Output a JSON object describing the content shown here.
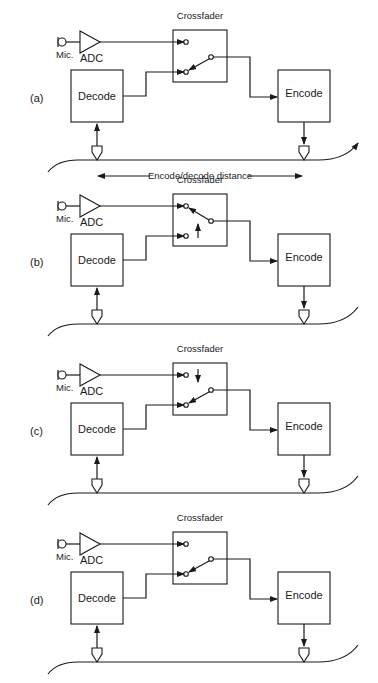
{
  "figure": {
    "ink_color": "#1a1a1a",
    "background": "#ffffff",
    "distance_label": "Encode/decode distance",
    "panels": [
      {
        "id": "a",
        "label": "(a)",
        "crossfader_label": "Crossfader",
        "mic_label": "Mic.",
        "adc_label": "ADC",
        "decode_label": "Decode",
        "encode_label": "Encode",
        "switch_position": "decode",
        "motion_arrow": "none",
        "tape_arrow": true
      },
      {
        "id": "b",
        "label": "(b)",
        "crossfader_label": "Crossfader",
        "mic_label": "Mic.",
        "adc_label": "ADC",
        "decode_label": "Decode",
        "encode_label": "Encode",
        "switch_position": "mic",
        "motion_arrow": "up",
        "tape_arrow": false
      },
      {
        "id": "c",
        "label": "(c)",
        "crossfader_label": "Crossfader",
        "mic_label": "Mic.",
        "adc_label": "ADC",
        "decode_label": "Decode",
        "encode_label": "Encode",
        "switch_position": "decode",
        "motion_arrow": "down",
        "tape_arrow": false
      },
      {
        "id": "d",
        "label": "(d)",
        "crossfader_label": "Crossfader",
        "mic_label": "Mic.",
        "adc_label": "ADC",
        "decode_label": "Decode",
        "encode_label": "Encode",
        "switch_position": "decode",
        "motion_arrow": "none",
        "tape_arrow": false
      }
    ]
  }
}
